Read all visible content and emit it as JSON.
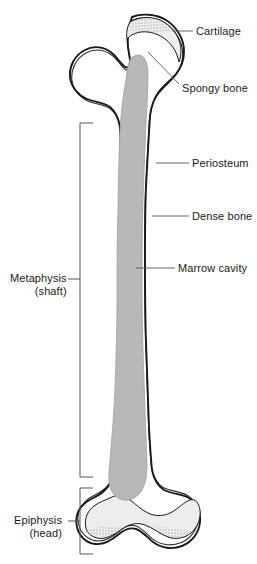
{
  "figure": {
    "background_color": "#ffffff",
    "outline_color": "#1a1a1a",
    "marrow_color": "#b8b8b8",
    "cartilage_color": "#e8e8e8",
    "label_color": "#1a1a1a",
    "width": 257,
    "height": 564
  },
  "labels_right": [
    {
      "id": "cartilage",
      "text": "Cartilage",
      "x": 196,
      "y": 25,
      "leader_from_x": 193,
      "leader_from_y": 31,
      "leader_to_x": 172,
      "leader_to_y": 31
    },
    {
      "id": "spongy-bone",
      "text": "Spongy bone",
      "x": 182,
      "y": 82,
      "leader_from_x": 179,
      "leader_from_y": 84,
      "leader_to_x": 148,
      "leader_to_y": 52
    },
    {
      "id": "periosteum",
      "text": "Periosteum",
      "x": 192,
      "y": 157,
      "leader_from_x": 189,
      "leader_from_y": 163,
      "leader_to_x": 156,
      "leader_to_y": 163
    },
    {
      "id": "dense-bone",
      "text": "Dense bone",
      "x": 192,
      "y": 210,
      "leader_from_x": 189,
      "leader_from_y": 216,
      "leader_to_x": 152,
      "leader_to_y": 216
    },
    {
      "id": "marrow-cavity",
      "text": "Marrow cavity",
      "x": 178,
      "y": 262,
      "leader_from_x": 175,
      "leader_from_y": 268,
      "leader_to_x": 136,
      "leader_to_y": 268
    }
  ],
  "labels_left": [
    {
      "id": "metaphysis",
      "text": "Metaphysis",
      "subtext": "(shaft)",
      "x": 10,
      "y": 272,
      "bracket_x": 80,
      "bracket_top": 123,
      "bracket_bottom": 477,
      "bracket_arm": 13,
      "leader_from_x": 68,
      "leader_from_y": 279,
      "leader_to_x": 80,
      "leader_to_y": 279
    },
    {
      "id": "epiphysis",
      "text": "Epiphysis",
      "subtext": "(head)",
      "x": 14,
      "y": 514,
      "bracket_x": 80,
      "bracket_top": 488,
      "bracket_bottom": 554,
      "bracket_arm": 13,
      "leader_from_x": 68,
      "leader_from_y": 521,
      "leader_to_x": 80,
      "leader_to_y": 521
    }
  ],
  "anatomy": {
    "bone_outer_path": "M 132 17 C 142 13 156 14 166 20 C 177 27 184 39 184 51 C 184 60 181 68 176 74 C 170 81 163 86 158 93 C 153 100 151 108 150 116 L 149 132 C 148 150 147 168 146 186 C 145 210 145 234 145 258 C 145 286 145 314 146 342 C 147 372 148 400 149 428 C 150 446 151 460 152 470 C 154 480 158 486 164 490 C 172 494 182 494 189 498 C 197 503 201 512 200 522 C 199 533 192 542 182 546 C 172 550 161 548 153 542 C 147 537 142 531 136 529 C 130 527 124 530 119 534 C 112 540 104 545 95 544 C 86 543 79 536 77 527 C 75 518 78 509 85 503 C 91 498 99 496 104 491 C 110 486 113 478 114 470 C 116 455 117 438 118 420 C 119 392 120 364 120 336 C 120 308 120 280 120 252 C 120 226 120 200 121 174 C 121 158 121 142 120 128 C 119 119 116 112 110 107 C 103 102 94 102 87 99 C 78 95 71 87 70 77 C 69 66 75 55 85 50 C 94 45 105 47 112 53 C 117 57 120 63 124 66 C 126 68 128 68 129 66 C 131 63 130 58 129 53 C 127 44 126 33 132 17 Z",
    "marrow_path": "M 131 58 C 136 54 141 54 144 58 C 147 62 148 68 148 75 C 148 90 147 106 146 122 C 145 148 144 174 143 200 C 142 230 142 260 142 290 C 142 320 143 350 144 380 C 145 410 146 438 147 462 C 147 474 146 483 142 490 C 138 497 131 501 124 500 C 117 499 112 494 110 487 C 108 479 109 470 110 460 C 112 436 114 412 115 388 C 116 358 117 328 117 298 C 117 268 117 238 118 208 C 118 182 119 156 120 130 C 121 112 123 96 126 80 C 127 70 128 63 131 58 Z",
    "cartilage_top_path": "M 130 22 C 140 16 154 16 164 22 C 175 29 181 40 181 51 C 181 55 180 59 179 62 C 178 57 176 51 172 46 C 166 38 157 33 148 32 C 139 31 131 34 127 39 C 126 33 127 27 130 22 Z",
    "cartilage_bottom_path": "M 86 528 C 84 520 87 511 94 506 C 99 502 106 500 112 497 C 118 494 124 496 130 500 C 136 504 141 510 148 513 C 156 517 165 516 172 512 C 179 508 184 502 190 500 C 195 498 199 503 200 510 C 201 518 198 527 191 533 C 185 538 176 540 168 537 C 160 534 153 528 145 525 C 137 522 129 524 122 529 C 114 535 105 540 97 538 C 91 536 87 533 86 528 Z",
    "neck_dotted_path": "M 110 107 C 116 112 119 119 120 128",
    "stipple_top": {
      "cx": 155,
      "cy": 24,
      "rx": 30,
      "ry": 9,
      "rotate": -4
    },
    "stipple_bottom": {
      "cx": 143,
      "cy": 533,
      "rx": 55,
      "ry": 7,
      "rotate": 2
    }
  }
}
